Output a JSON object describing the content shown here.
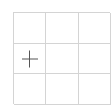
{
  "grid": {
    "rows": 3,
    "cols": 3,
    "line_color": "#d4d4d4",
    "cells": [
      {
        "row": 0,
        "col": 0,
        "icon": null
      },
      {
        "row": 0,
        "col": 1,
        "icon": null
      },
      {
        "row": 0,
        "col": 2,
        "icon": null
      },
      {
        "row": 1,
        "col": 0,
        "icon": "plus-icon"
      },
      {
        "row": 1,
        "col": 1,
        "icon": null
      },
      {
        "row": 1,
        "col": 2,
        "icon": null
      },
      {
        "row": 2,
        "col": 0,
        "icon": null
      },
      {
        "row": 2,
        "col": 1,
        "icon": null
      },
      {
        "row": 2,
        "col": 2,
        "icon": null
      }
    ],
    "icon_color": "#555555"
  }
}
